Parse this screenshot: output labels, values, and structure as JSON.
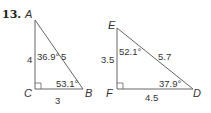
{
  "problem_number": "13.",
  "triangle1": {
    "vertices": {
      "A": "A",
      "B": "B",
      "C": "C"
    },
    "sides": {
      "AC": "4",
      "AB": "5",
      "CB": "3"
    },
    "angles": {
      "A": "36.9°",
      "B": "53.1°"
    },
    "right_angle_at": "C"
  },
  "triangle2": {
    "vertices": {
      "E": "E",
      "D": "D",
      "F": "F"
    },
    "sides": {
      "EF": "3.5",
      "ED": "5.7",
      "FD": "4.5"
    },
    "angles": {
      "E": "52.1°",
      "D": "37.9°"
    },
    "right_angle_at": "F"
  }
}
